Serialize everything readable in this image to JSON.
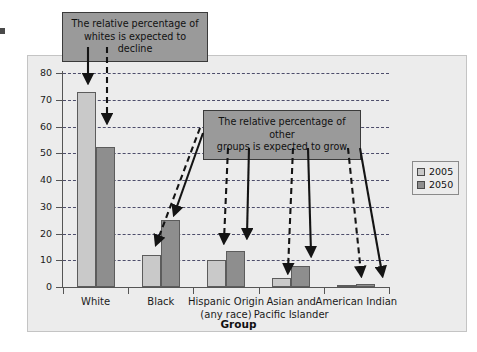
{
  "chart_data": {
    "type": "bar",
    "title": "",
    "xlabel": "Group",
    "ylabel": "Percentage",
    "ylim": [
      0,
      80
    ],
    "yticks": [
      0,
      10,
      20,
      30,
      40,
      50,
      60,
      70,
      80
    ],
    "grid": "horizontal-dashed",
    "legend_position": "right",
    "categories": [
      "White",
      "Black",
      "Hispanic Origin\n(any race)",
      "Asian and\nPacific Islander",
      "American Indian"
    ],
    "category_lines": [
      [
        "White",
        ""
      ],
      [
        "Black",
        ""
      ],
      [
        "Hispanic Origin",
        "(any race)"
      ],
      [
        "Asian and",
        "Pacific Islander"
      ],
      [
        "American Indian",
        ""
      ]
    ],
    "series": [
      {
        "name": "2005",
        "color": "#c9c9c9",
        "values": [
          73,
          12,
          10,
          3.5,
          0.8
        ]
      },
      {
        "name": "2050",
        "color": "#8e8e8e",
        "values": [
          52.5,
          25,
          13.5,
          8,
          1
        ]
      }
    ],
    "annotations": [
      {
        "id": "whites",
        "text_lines": [
          "The relative percentage of",
          "whites is expected to decline"
        ]
      },
      {
        "id": "others",
        "text_lines": [
          "The relative percentage of other",
          "groups is expected to grow"
        ]
      }
    ]
  },
  "legend": {
    "items": [
      {
        "label": "2005",
        "color": "#c9c9c9"
      },
      {
        "label": "2050",
        "color": "#8e8e8e"
      }
    ]
  },
  "axes": {
    "y_title": "Percentage",
    "x_title": "Group",
    "y_tick_labels": [
      "80",
      "70",
      "60",
      "50",
      "40",
      "30",
      "20",
      "10",
      "0"
    ]
  },
  "callouts": {
    "whites": "The relative percentage of whites is expected to decline",
    "whites_line1": "The relative percentage of",
    "whites_line2": "whites is expected to decline",
    "others": "The relative percentage of other groups is expected to grow",
    "others_line1": "The relative percentage of other",
    "others_line2": "groups is expected to grow"
  },
  "colors": {
    "series_2005": "#c9c9c9",
    "series_2050": "#8e8e8e",
    "plot_background": "#ececec",
    "gridline": "#4d4d6b",
    "callout_background": "#9a9a9a"
  }
}
